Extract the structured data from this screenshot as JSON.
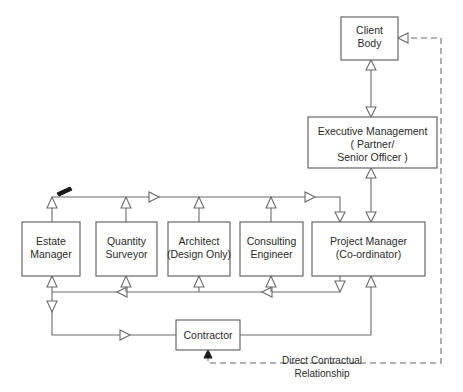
{
  "diagram": {
    "nodes": [
      {
        "id": "client-body",
        "lines": [
          "Client",
          "Body"
        ],
        "x": 341,
        "y": 17,
        "w": 57,
        "h": 43
      },
      {
        "id": "executive-management",
        "lines": [
          "Executive Management",
          "( Partner/",
          "Senior Officer )"
        ],
        "x": 308,
        "y": 117,
        "w": 129,
        "h": 51
      },
      {
        "id": "estate-manager",
        "lines": [
          "Estate",
          "Manager"
        ],
        "x": 22,
        "y": 222,
        "w": 58,
        "h": 54
      },
      {
        "id": "quantity-surveyor",
        "lines": [
          "Quantity",
          "Surveyor"
        ],
        "x": 96,
        "y": 222,
        "w": 61,
        "h": 54
      },
      {
        "id": "architect",
        "lines": [
          "Architect",
          "(Design Only)"
        ],
        "x": 168,
        "y": 222,
        "w": 62,
        "h": 54
      },
      {
        "id": "consulting-engineer",
        "lines": [
          "Consulting",
          "Engineer"
        ],
        "x": 240,
        "y": 222,
        "w": 63,
        "h": 54
      },
      {
        "id": "project-manager",
        "lines": [
          "Project Manager",
          "(Co-ordinator)"
        ],
        "x": 312,
        "y": 222,
        "w": 113,
        "h": 54
      },
      {
        "id": "contractor",
        "lines": [
          "Contractor"
        ],
        "x": 176,
        "y": 320,
        "w": 64,
        "h": 30
      }
    ],
    "legend": {
      "lines": [
        "Direct Contractual",
        "Relationship"
      ],
      "line_style": "dashed",
      "x": 322,
      "y": 360
    },
    "colors": {
      "background": "#ffffff",
      "box_stroke": "#5a5a5a",
      "connector": "#6b6b6b",
      "text": "#2b2b2b",
      "solid_arrow": "#1a1a1a"
    }
  }
}
